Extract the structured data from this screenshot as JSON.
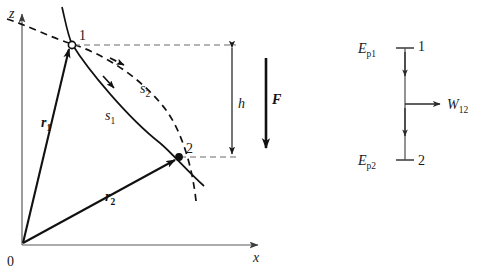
{
  "figure": {
    "axes": {
      "z_label": "z",
      "x_label": "x",
      "origin_label": "0"
    },
    "points": [
      {
        "id": "point-1",
        "label": "1",
        "marker": "open-circle"
      },
      {
        "id": "point-2",
        "label": "2",
        "marker": "filled-dot"
      }
    ],
    "paths": [
      {
        "id": "path-s1",
        "label": "s",
        "sub": "1",
        "style": "solid"
      },
      {
        "id": "path-s2",
        "label": "s",
        "sub": "2",
        "style": "dashed"
      }
    ],
    "vectors": [
      {
        "id": "vector-r1",
        "label": "r",
        "sub": "1"
      },
      {
        "id": "vector-r2",
        "label": "r",
        "sub": "2"
      }
    ],
    "height_dimension": {
      "label": "h"
    },
    "force": {
      "label": "F"
    }
  },
  "energy_diagram": {
    "top": {
      "symbol": "E",
      "sub": "p1",
      "point": "1"
    },
    "bottom": {
      "symbol": "E",
      "sub": "p2",
      "point": "2"
    },
    "work": {
      "symbol": "W",
      "sub": "12"
    }
  },
  "colors": {
    "ink": "#111111",
    "axis": "#5a5a5a",
    "guide": "#6a6a6a",
    "background": "#ffffff"
  }
}
